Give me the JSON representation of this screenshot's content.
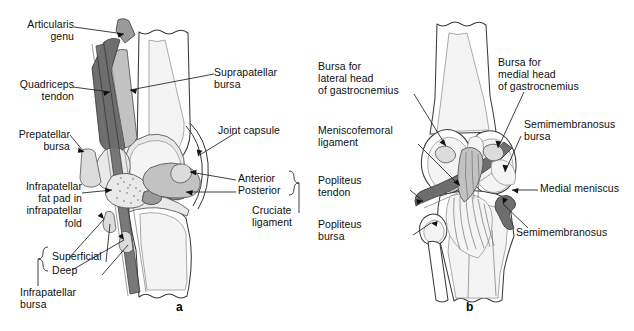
{
  "figure": {
    "type": "anatomical-illustration",
    "background_color": "#ffffff",
    "ink_color": "#1a1a1a",
    "panels": [
      {
        "id": "a",
        "letter": "a",
        "view": "sagittal section of knee",
        "labels": [
          {
            "id": "articularis-genu",
            "text": "Articularis\ngenu"
          },
          {
            "id": "quadriceps-tendon",
            "text": "Quadriceps\ntendon"
          },
          {
            "id": "prepatellar-bursa",
            "text": "Prepatellar\nbursa"
          },
          {
            "id": "infrapatellar-fat-pad",
            "text": "Infrapatellar\nfat pad in\ninfrapatellar\nfold"
          },
          {
            "id": "suprapatellar-bursa",
            "text": "Suprapatellar\nbursa"
          },
          {
            "id": "joint-capsule",
            "text": "Joint capsule"
          },
          {
            "id": "anterior",
            "text": "Anterior"
          },
          {
            "id": "posterior",
            "text": "Posterior"
          },
          {
            "id": "cruciate-ligament",
            "text": "Cruciate\nligament"
          },
          {
            "id": "superficial",
            "text": "Superficial"
          },
          {
            "id": "deep",
            "text": "Deep"
          },
          {
            "id": "infrapatellar-bursa",
            "text": "Infrapatellar\nbursa"
          }
        ]
      },
      {
        "id": "b",
        "letter": "b",
        "view": "posterior view of knee",
        "labels": [
          {
            "id": "bursa-lateral-gastrocnemius",
            "text": "Bursa for\nlateral head\nof gastrocnemius"
          },
          {
            "id": "meniscofemoral-ligament",
            "text": "Meniscofemoral\nligament"
          },
          {
            "id": "popliteus-tendon",
            "text": "Popliteus\ntendon"
          },
          {
            "id": "popliteus-bursa",
            "text": "Popliteus\nbursa"
          },
          {
            "id": "bursa-medial-gastrocnemius",
            "text": "Bursa for\nmedial head\nof gastrocnemius"
          },
          {
            "id": "semimembranosus-bursa",
            "text": "Semimembranosus\nbursa"
          },
          {
            "id": "medial-meniscus",
            "text": "Medial meniscus"
          },
          {
            "id": "semimembranosus",
            "text": "Semimembranosus"
          }
        ]
      }
    ]
  }
}
